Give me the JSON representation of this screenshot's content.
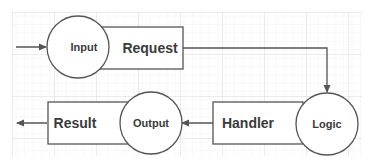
{
  "diagram": {
    "nodes": [
      {
        "id": "input",
        "shape": "circle",
        "label": "Input"
      },
      {
        "id": "request",
        "shape": "rect",
        "label": "Request"
      },
      {
        "id": "logic",
        "shape": "circle",
        "label": "Logic"
      },
      {
        "id": "handler",
        "shape": "rect",
        "label": "Handler"
      },
      {
        "id": "output",
        "shape": "circle",
        "label": "Output"
      },
      {
        "id": "result",
        "shape": "rect",
        "label": "Result"
      }
    ],
    "edges": [
      {
        "from": "external",
        "to": "input"
      },
      {
        "from": "request",
        "to": "logic"
      },
      {
        "from": "handler",
        "to": "output"
      },
      {
        "from": "result",
        "to": "external"
      }
    ],
    "colors": {
      "stroke": "#555555",
      "text": "#3a3a3a",
      "grid_major": "#d8d8d8",
      "grid_minor": "#eeeeee",
      "background": "#ffffff"
    }
  }
}
